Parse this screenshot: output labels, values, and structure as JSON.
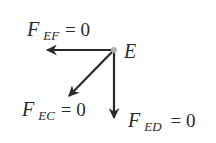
{
  "diagram": {
    "type": "free-body-diagram",
    "joint": {
      "label": "E",
      "color": "#b0b0b0"
    },
    "forces": [
      {
        "id": "EF",
        "symbol": "F",
        "subscript": "EF",
        "equals": "= 0",
        "direction": "left"
      },
      {
        "id": "EC",
        "symbol": "F",
        "subscript": "EC",
        "equals": "= 0",
        "direction": "down-left"
      },
      {
        "id": "ED",
        "symbol": "F",
        "subscript": "ED",
        "equals": "= 0",
        "direction": "down"
      }
    ],
    "arrow_color": "#2a2a2a"
  }
}
